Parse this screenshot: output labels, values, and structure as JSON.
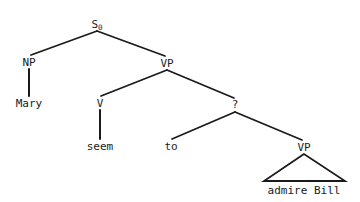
{
  "diagram": {
    "kind": "syntax-tree",
    "background_color": "#ffffff",
    "line_color": "#1a1a1a",
    "text_color": "#1a1a1a",
    "nodes": [
      {
        "id": "s0",
        "text": "S",
        "subscript": "0",
        "x": 97,
        "y": 24,
        "type": "nonterminal"
      },
      {
        "id": "np",
        "text": "NP",
        "subscript": "",
        "x": 29,
        "y": 62,
        "type": "nonterminal"
      },
      {
        "id": "mary",
        "text": "Mary",
        "subscript": "",
        "x": 29,
        "y": 103,
        "type": "terminal"
      },
      {
        "id": "vp1",
        "text": "VP",
        "subscript": "",
        "x": 167,
        "y": 63,
        "type": "nonterminal"
      },
      {
        "id": "v",
        "text": "V",
        "subscript": "",
        "x": 100,
        "y": 103,
        "type": "nonterminal"
      },
      {
        "id": "seem",
        "text": "seem",
        "subscript": "",
        "x": 100,
        "y": 146,
        "type": "terminal"
      },
      {
        "id": "q",
        "text": "?",
        "subscript": "",
        "x": 235,
        "y": 104,
        "type": "nonterminal"
      },
      {
        "id": "to",
        "text": "to",
        "subscript": "",
        "x": 171,
        "y": 146,
        "type": "terminal"
      },
      {
        "id": "vp2",
        "text": "VP",
        "subscript": "",
        "x": 304,
        "y": 147,
        "type": "nonterminal"
      },
      {
        "id": "admirebill",
        "text": "admire Bill",
        "subscript": "",
        "x": 304,
        "y": 190,
        "type": "terminal"
      }
    ],
    "edges": [
      {
        "from": "s0",
        "to": "np",
        "x1": 97,
        "y1": 31,
        "x2": 31,
        "y2": 55,
        "style": "diagonal"
      },
      {
        "from": "s0",
        "to": "vp1",
        "x1": 97,
        "y1": 31,
        "x2": 165,
        "y2": 56,
        "style": "diagonal"
      },
      {
        "from": "np",
        "to": "mary",
        "x1": 29,
        "y1": 69,
        "x2": 29,
        "y2": 96,
        "style": "vertical"
      },
      {
        "from": "vp1",
        "to": "v",
        "x1": 167,
        "y1": 70,
        "x2": 101,
        "y2": 96,
        "style": "diagonal"
      },
      {
        "from": "vp1",
        "to": "q",
        "x1": 167,
        "y1": 70,
        "x2": 234,
        "y2": 98,
        "style": "diagonal"
      },
      {
        "from": "v",
        "to": "seem",
        "x1": 100,
        "y1": 110,
        "x2": 100,
        "y2": 139,
        "style": "vertical"
      },
      {
        "from": "q",
        "to": "to",
        "x1": 235,
        "y1": 112,
        "x2": 172,
        "y2": 139,
        "style": "diagonal"
      },
      {
        "from": "q",
        "to": "vp2",
        "x1": 235,
        "y1": 112,
        "x2": 302,
        "y2": 140,
        "style": "diagonal"
      }
    ],
    "triangles": [
      {
        "under": "vp2",
        "label": "admire Bill",
        "apex_x": 304,
        "apex_y": 154,
        "left_x": 264,
        "left_y": 181,
        "right_x": 345,
        "right_y": 181
      }
    ],
    "sentence": "Mary seem to admire Bill"
  }
}
